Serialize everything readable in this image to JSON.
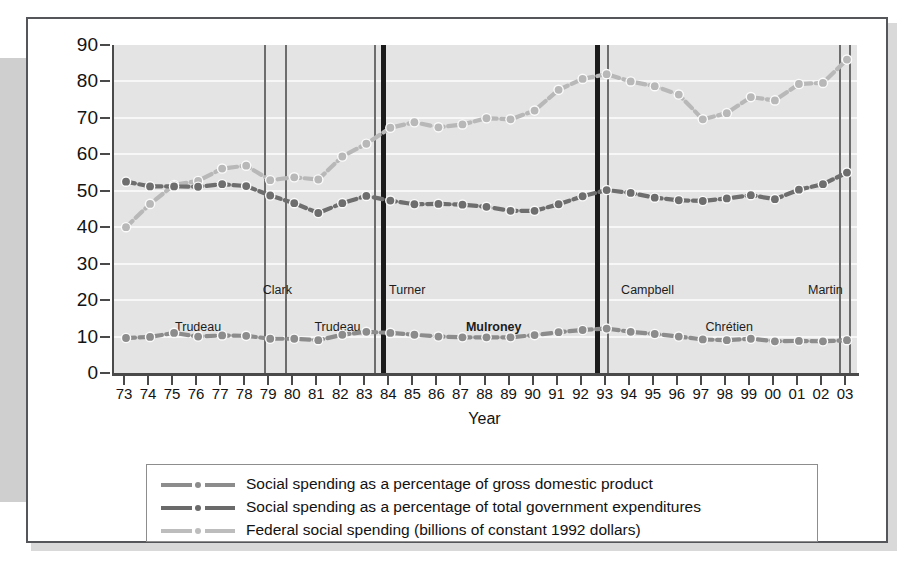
{
  "chart_data": {
    "type": "line",
    "title": "",
    "xlabel": "Year",
    "ylabel": "",
    "ylim": [
      0,
      90
    ],
    "ytick_step": 10,
    "grid": true,
    "legend_position": "below-plot",
    "categories": [
      "73",
      "74",
      "75",
      "76",
      "77",
      "78",
      "79",
      "80",
      "81",
      "82",
      "83",
      "84",
      "85",
      "86",
      "87",
      "88",
      "89",
      "90",
      "91",
      "92",
      "93",
      "94",
      "95",
      "96",
      "97",
      "98",
      "99",
      "00",
      "01",
      "02",
      "03"
    ],
    "series": [
      {
        "name": "Social spending as a percentage of total government expenditures",
        "color": "#6e6e6e",
        "values": [
          52.5,
          51.2,
          51.2,
          51.1,
          51.8,
          51.3,
          48.7,
          46.6,
          43.9,
          46.6,
          48.6,
          47.3,
          46.3,
          46.4,
          46.2,
          45.6,
          44.5,
          44.5,
          46.3,
          48.5,
          50.2,
          49.4,
          48.1,
          47.4,
          47.2,
          47.9,
          48.8,
          47.7,
          50.3,
          51.8,
          55.0
        ]
      },
      {
        "name": "Federal social spending (billions of constant 1992 dollars)",
        "color": "#b8b8b8",
        "values": [
          40.0,
          46.4,
          51.6,
          52.7,
          56.1,
          56.9,
          52.9,
          53.7,
          53.1,
          59.4,
          62.9,
          67.3,
          68.8,
          67.4,
          68.2,
          69.9,
          69.6,
          72.0,
          77.7,
          80.7,
          82.0,
          80.0,
          78.7,
          76.4,
          69.6,
          71.3,
          75.7,
          74.8,
          79.3,
          79.6,
          86.0
        ]
      },
      {
        "name": "Social spending as a percentage of gross domestic product",
        "color": "#8c8c8c",
        "values": [
          9.6,
          9.9,
          11.0,
          10.0,
          10.3,
          10.2,
          9.4,
          9.4,
          9.0,
          10.5,
          11.3,
          11.0,
          10.5,
          10.0,
          9.8,
          9.8,
          9.8,
          10.4,
          11.2,
          11.8,
          12.2,
          11.3,
          10.7,
          10.0,
          9.2,
          9.0,
          9.4,
          8.7,
          8.8,
          8.7,
          9.0
        ]
      }
    ],
    "annotations": [
      {
        "label": "Trudeau",
        "year_center": "76",
        "bold": false
      },
      {
        "label": "Clark",
        "year_center": "79.5",
        "bold": false
      },
      {
        "label": "Trudeau",
        "year_center": "82",
        "bold": false
      },
      {
        "label": "Turner",
        "year_center": "84",
        "bold": false
      },
      {
        "label": "Mulroney",
        "year_center": "88.5",
        "bold": true
      },
      {
        "label": "Campbell",
        "year_center": "93.2",
        "bold": false
      },
      {
        "label": "Chrétien",
        "year_center": "98.5",
        "bold": false
      },
      {
        "label": "Martin",
        "year_center": "103",
        "bold": false
      }
    ]
  },
  "yaxis": {
    "ticks": [
      "90",
      "80",
      "70",
      "60",
      "50",
      "40",
      "30",
      "20",
      "10",
      "0"
    ]
  },
  "xaxis": {
    "title": "Year",
    "labels": [
      "73",
      "74",
      "75",
      "76",
      "77",
      "78",
      "79",
      "80",
      "81",
      "82",
      "83",
      "84",
      "85",
      "86",
      "87",
      "88",
      "89",
      "90",
      "91",
      "92",
      "93",
      "94",
      "95",
      "96",
      "97",
      "98",
      "99",
      "00",
      "01",
      "02",
      "03"
    ]
  },
  "era_labels": {
    "trudeau_1": "Trudeau",
    "clark": "Clark",
    "trudeau_2": "Trudeau",
    "turner": "Turner",
    "mulroney": "Mulroney",
    "campbell": "Campbell",
    "chretien": "Chrétien",
    "martin": "Martin"
  },
  "legend": {
    "items": [
      {
        "label": "Social spending as a percentage of gross domestic product",
        "color": "#8c8c8c"
      },
      {
        "label": "Social spending as a percentage of total government expenditures",
        "color": "#6a6a6a"
      },
      {
        "label": "Federal social spending (billions of constant 1992 dollars)",
        "color": "#bdbdbd"
      }
    ]
  },
  "colors": {
    "plot_background": "#e4e4e4",
    "gridline": "#f7f7f7",
    "axis": "#4a4a4a",
    "frame": "#55565a",
    "era_thick": "#1b1b1b",
    "era_thin": "#6d6d6d"
  }
}
